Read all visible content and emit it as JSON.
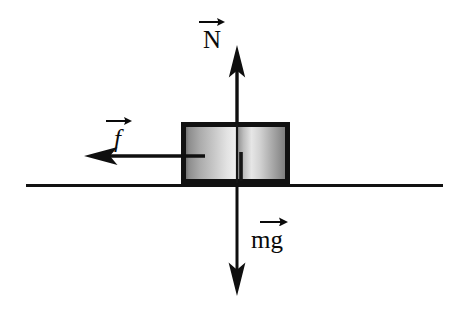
{
  "figure": {
    "type": "free-body-diagram",
    "background_color": "#ffffff",
    "ink_color": "#0a0a0a"
  },
  "labels": {
    "normal_force": "N",
    "friction_force": "f",
    "weight_force": "mg",
    "normal_force_accent": "vector-arrow",
    "friction_force_accent": "vector-arrow",
    "weight_force_accent": "vector-arrow"
  },
  "forces": [
    {
      "name": "normal-force",
      "symbol": "N",
      "direction": "up",
      "tail": {
        "x": 237,
        "y": 183
      },
      "tip": {
        "x": 237,
        "y": 45
      },
      "length_px": 138
    },
    {
      "name": "friction-force",
      "symbol": "f",
      "direction": "left",
      "tail": {
        "x": 205,
        "y": 156
      },
      "tip": {
        "x": 84,
        "y": 156
      },
      "length_px": 121
    },
    {
      "name": "weight-force",
      "symbol": "mg",
      "direction": "down",
      "tail": {
        "x": 237,
        "y": 186
      },
      "tip": {
        "x": 237,
        "y": 296
      },
      "length_px": 110
    }
  ],
  "block": {
    "name": "block",
    "left": 181,
    "top": 122,
    "width": 109,
    "height": 62,
    "border_color": "#111111",
    "border_width": 5,
    "fill_gradient": {
      "type": "linear-horizontal-double",
      "stops": [
        "#6e6e6e",
        "#c9c9c9",
        "#f0f0f0",
        "#8a8a8a",
        "#d9d9d9",
        "#f2f2f2",
        "#9a9a9a",
        "#7a7a7a"
      ]
    }
  },
  "ground": {
    "name": "ground-line",
    "x1": 26,
    "x2": 443,
    "y": 185,
    "thickness": 3,
    "color": "#111111"
  },
  "colors": {
    "ink": "#0a0a0a",
    "block_border": "#111111",
    "ground": "#111111",
    "background": "#ffffff"
  }
}
